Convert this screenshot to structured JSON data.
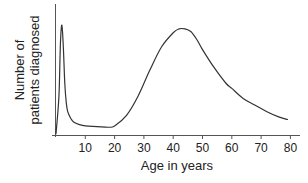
{
  "chart_data": {
    "type": "line",
    "title": "",
    "xlabel": "Age in years",
    "ylabel": [
      "Number of",
      "patients diagnosed"
    ],
    "xlim": [
      0,
      83
    ],
    "ylim": [
      0,
      100
    ],
    "xticks": [
      10,
      20,
      30,
      40,
      50,
      60,
      70,
      80
    ],
    "xtick_labels": [
      "10",
      "20",
      "30",
      "40",
      "50",
      "60",
      "70",
      "80"
    ],
    "yticks": [],
    "grid": false,
    "legend": null,
    "series": [
      {
        "name": "Patients diagnosed (relative)",
        "x": [
          0,
          1,
          1.5,
          2,
          2.5,
          3,
          3.5,
          4,
          5,
          6,
          8,
          10,
          14,
          18,
          20,
          24,
          28,
          32,
          36,
          40,
          42,
          44,
          46,
          48,
          50,
          54,
          58,
          60,
          64,
          68,
          72,
          76,
          79
        ],
        "values": [
          1,
          30,
          70,
          85,
          68,
          40,
          25,
          18,
          13,
          10,
          8,
          7,
          6.5,
          6,
          7,
          15,
          30,
          50,
          68,
          79,
          82,
          82,
          80,
          74,
          66,
          52,
          40,
          36,
          28,
          23,
          18,
          14,
          12
        ]
      }
    ],
    "annotations": []
  },
  "axes": {
    "x_label": "Age in years",
    "y_label_line1": "Number of",
    "y_label_line2": "patients diagnosed",
    "tick_labels": [
      "10",
      "20",
      "30",
      "40",
      "50",
      "60",
      "70",
      "80"
    ]
  },
  "colors": {
    "line": "#333333",
    "axis": "#555555",
    "text": "#222222",
    "background": "#ffffff"
  }
}
